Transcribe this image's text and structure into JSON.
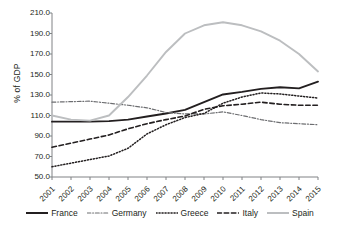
{
  "chart_data": {
    "type": "line",
    "title": "",
    "xlabel": "",
    "ylabel": "% of GDP",
    "x": [
      2001,
      2002,
      2003,
      2004,
      2005,
      2006,
      2007,
      2008,
      2009,
      2010,
      2011,
      2012,
      2013,
      2014,
      2015
    ],
    "categories": [
      "2001",
      "2002",
      "2003",
      "2004",
      "2005",
      "2006",
      "2007",
      "2008",
      "2009",
      "2010",
      "2011",
      "2012",
      "2013",
      "2014",
      "2015"
    ],
    "ylim": [
      50.0,
      210.0
    ],
    "yticks": [
      50.0,
      70.0,
      90.0,
      110.0,
      130.0,
      150.0,
      170.0,
      190.0,
      210.0
    ],
    "ytick_labels": [
      "50.0",
      "70.0",
      "90.0",
      "110.0",
      "130.0",
      "150.0",
      "170.0",
      "190.0",
      "210.0"
    ],
    "grid": false,
    "legend_position": "bottom",
    "series": [
      {
        "name": "France",
        "style": "solid",
        "color": "#231f20",
        "width": 1.9,
        "values": [
          104.0,
          104.0,
          104.0,
          104.5,
          106.0,
          109.0,
          112.0,
          115.5,
          123.0,
          130.5,
          133.0,
          136.0,
          137.5,
          136.5,
          143.0
        ]
      },
      {
        "name": "Germany",
        "style": "dash-dot",
        "color": "#6d6e71",
        "width": 1.2,
        "values": [
          123.0,
          123.5,
          124.0,
          122.0,
          120.0,
          117.5,
          113.0,
          111.5,
          111.5,
          113.5,
          110.0,
          106.0,
          103.0,
          102.0,
          101.0
        ]
      },
      {
        "name": "Greece",
        "style": "dotted",
        "color": "#231f20",
        "width": 1.5,
        "values": [
          60.0,
          63.5,
          67.0,
          70.5,
          78.0,
          92.0,
          101.0,
          108.0,
          112.0,
          122.0,
          128.0,
          132.0,
          131.0,
          129.0,
          127.0
        ]
      },
      {
        "name": "Italy",
        "style": "dashed",
        "color": "#231f20",
        "width": 1.6,
        "values": [
          79.0,
          83.0,
          87.0,
          91.0,
          97.0,
          102.0,
          106.0,
          109.5,
          116.0,
          119.5,
          121.0,
          123.0,
          121.0,
          120.0,
          120.0
        ]
      },
      {
        "name": "Spain",
        "style": "solid",
        "color": "#bcbec0",
        "width": 1.9,
        "values": [
          110.0,
          106.0,
          105.0,
          110.0,
          128.0,
          149.0,
          172.0,
          190.0,
          198.0,
          201.0,
          198.0,
          192.0,
          183.0,
          170.0,
          153.0
        ]
      }
    ]
  },
  "legend": {
    "items": [
      {
        "label": "France"
      },
      {
        "label": "Germany"
      },
      {
        "label": "Greece"
      },
      {
        "label": "Italy"
      },
      {
        "label": "Spain"
      }
    ]
  }
}
